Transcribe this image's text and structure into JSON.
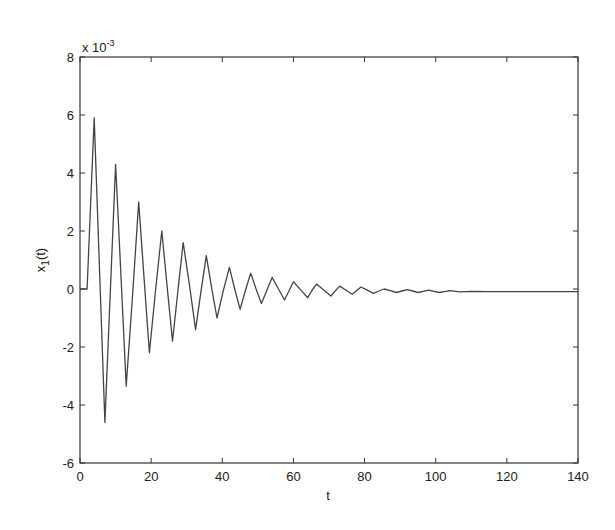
{
  "chart_data": {
    "type": "line",
    "title": "",
    "xlabel": "t",
    "ylabel": "x_1(t)",
    "ylabel_main": "x",
    "ylabel_sub": "1",
    "ylabel_tail": "(t)",
    "y_exponent_label": "x 10",
    "y_exponent_power": "-3",
    "xlim": [
      0,
      140
    ],
    "ylim": [
      -6,
      8
    ],
    "y_scale_factor": 0.001,
    "grid": false,
    "legend": null,
    "xticks": [
      0,
      20,
      40,
      60,
      80,
      100,
      120,
      140
    ],
    "xtick_labels": [
      "0",
      "20",
      "40",
      "60",
      "80",
      "100",
      "120",
      "140"
    ],
    "yticks": [
      -6,
      -4,
      -2,
      0,
      2,
      4,
      6,
      8
    ],
    "ytick_labels": [
      "-6",
      "-4",
      "-2",
      "0",
      "2",
      "4",
      "6",
      "8"
    ],
    "line_color": "#444444",
    "series": [
      {
        "name": "x1(t)",
        "x": [
          0,
          2,
          2.5,
          4,
          5.5,
          7,
          8.5,
          10,
          11.5,
          13,
          14.8,
          16.5,
          18,
          19.5,
          21.2,
          23,
          24.5,
          26,
          27.5,
          29,
          30.8,
          32.5,
          34,
          35.5,
          37,
          38.5,
          40.2,
          42,
          43.5,
          45,
          46.5,
          48,
          49.5,
          51,
          52.5,
          54,
          55.8,
          57.5,
          58.8,
          60,
          62,
          64,
          65.2,
          66.5,
          68.5,
          70.5,
          71.8,
          73,
          74.8,
          76.5,
          77.8,
          79,
          80.8,
          82.5,
          84,
          85.5,
          87.2,
          89,
          90.5,
          92,
          93.5,
          95,
          96.5,
          98,
          99.5,
          101,
          102.5,
          104,
          105.5,
          107,
          108.5,
          110,
          115,
          120,
          130,
          140
        ],
        "y": [
          0,
          0,
          1.5,
          5.9,
          0.6,
          -4.6,
          -0.2,
          4.3,
          0.5,
          -3.35,
          -0.2,
          3.0,
          0.4,
          -2.2,
          -0.1,
          2.0,
          0.1,
          -1.8,
          -0.1,
          1.6,
          0.1,
          -1.4,
          -0.1,
          1.15,
          0.05,
          -1.0,
          -0.1,
          0.75,
          0.0,
          -0.7,
          -0.05,
          0.55,
          0.0,
          -0.5,
          -0.05,
          0.4,
          0.0,
          -0.38,
          -0.05,
          0.25,
          -0.02,
          -0.3,
          -0.05,
          0.17,
          -0.03,
          -0.24,
          -0.06,
          0.1,
          -0.04,
          -0.18,
          -0.05,
          0.07,
          -0.04,
          -0.15,
          -0.07,
          0.0,
          -0.06,
          -0.12,
          -0.07,
          -0.02,
          -0.07,
          -0.12,
          -0.08,
          -0.04,
          -0.08,
          -0.12,
          -0.09,
          -0.06,
          -0.08,
          -0.1,
          -0.09,
          -0.08,
          -0.09,
          -0.09,
          -0.09,
          -0.09
        ]
      }
    ]
  }
}
